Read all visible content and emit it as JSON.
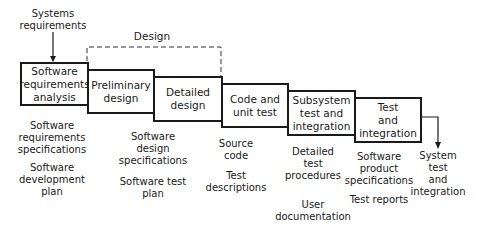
{
  "input": "Systems\nrequirements",
  "design_group_label": "Design",
  "phases": [
    {
      "label": "Software\nrequirements\nanalysis"
    },
    {
      "label": "Preliminary\ndesign"
    },
    {
      "label": "Detailed\ndesign"
    },
    {
      "label": "Code and\nunit test"
    },
    {
      "label": "Subsystem\ntest and\nintegration"
    },
    {
      "label": "Test\nand\nintegration"
    }
  ],
  "next_step": "System test\nand\nintegration",
  "outputs": {
    "requirements": [
      "Software\nrequirements\nspecifications",
      "Software\ndevelopment\nplan"
    ],
    "design": [
      "Software\ndesign\nspecifications",
      "Software test\nplan"
    ],
    "code": [
      "Source\ncode",
      "Test\ndescriptions"
    ],
    "subsystem": [
      "Detailed\ntest\nprocedures",
      "User\ndocumentation"
    ],
    "integration": [
      "Software\nproduct\nspecifications",
      "Test reports"
    ]
  }
}
